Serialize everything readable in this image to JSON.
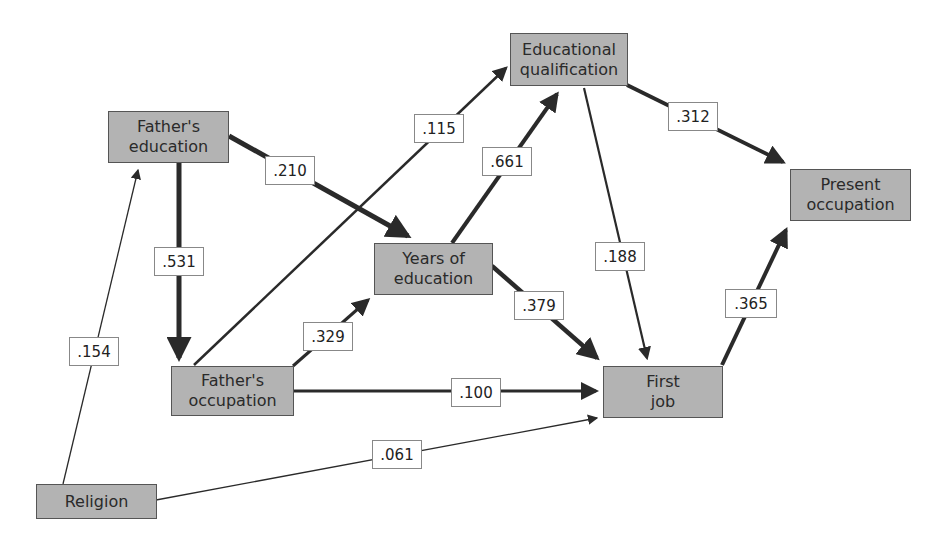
{
  "diagram": {
    "type": "path-diagram",
    "nodes": {
      "fathers_education": {
        "line1": "Father's",
        "line2": "education"
      },
      "educational_qualification": {
        "line1": "Educational",
        "line2": "qualification"
      },
      "present_occupation": {
        "line1": "Present",
        "line2": "occupation"
      },
      "years_of_education": {
        "line1": "Years of",
        "line2": "education"
      },
      "fathers_occupation": {
        "line1": "Father's",
        "line2": "occupation"
      },
      "first_job": {
        "line1": "First",
        "line2": "job"
      },
      "religion": {
        "line1": "Religion"
      }
    },
    "edges": {
      "religion_to_fathers_education": {
        "from": "Religion",
        "to": "Father's education",
        "coef": ".154"
      },
      "fathers_education_to_fathers_occupation": {
        "from": "Father's education",
        "to": "Father's occupation",
        "coef": ".531"
      },
      "fathers_education_to_years_of_education": {
        "from": "Father's education",
        "to": "Years of education",
        "coef": ".210"
      },
      "fathers_occupation_to_educational_qualification": {
        "from": "Father's occupation",
        "to": "Educational qualification",
        "coef": ".115"
      },
      "fathers_occupation_to_years_of_education": {
        "from": "Father's occupation",
        "to": "Years of education",
        "coef": ".329"
      },
      "fathers_occupation_to_first_job": {
        "from": "Father's occupation",
        "to": "First job",
        "coef": ".100"
      },
      "years_of_education_to_educational_qualification": {
        "from": "Years of education",
        "to": "Educational qualification",
        "coef": ".661"
      },
      "years_of_education_to_first_job": {
        "from": "Years of education",
        "to": "First job",
        "coef": ".379"
      },
      "educational_qualification_to_first_job": {
        "from": "Educational qualification",
        "to": "First job",
        "coef": ".188"
      },
      "educational_qualification_to_present_occupation": {
        "from": "Educational qualification",
        "to": "Present occupation",
        "coef": ".312"
      },
      "first_job_to_present_occupation": {
        "from": "First job",
        "to": "Present occupation",
        "coef": ".365"
      },
      "religion_to_first_job": {
        "from": "Religion",
        "to": "First job",
        "coef": ".061"
      }
    },
    "colors": {
      "node_fill": "#b3b3b3",
      "node_border": "#555555",
      "edge": "#2a2a2a",
      "label_bg": "#ffffff"
    }
  }
}
